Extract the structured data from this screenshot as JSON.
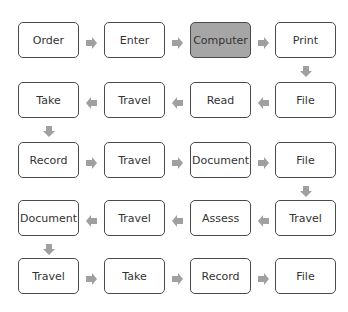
{
  "diagram": {
    "type": "flowchart-snake",
    "highlight_color": "#a6a6a6",
    "arrow_color": "#a0a0a0",
    "rows": [
      {
        "direction": "right",
        "nodes": [
          "Order",
          "Enter",
          "Computer",
          "Print"
        ]
      },
      {
        "direction": "left",
        "nodes": [
          "Take",
          "Travel",
          "Read",
          "File"
        ]
      },
      {
        "direction": "right",
        "nodes": [
          "Record",
          "Travel",
          "Document",
          "File"
        ]
      },
      {
        "direction": "left",
        "nodes": [
          "Document",
          "Travel",
          "Assess",
          "Travel"
        ]
      },
      {
        "direction": "right",
        "nodes": [
          "Travel",
          "Take",
          "Record",
          "File"
        ]
      }
    ],
    "highlighted": "Computer"
  }
}
